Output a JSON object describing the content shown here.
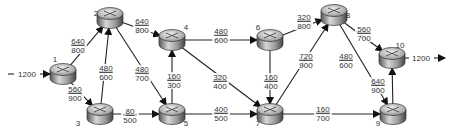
{
  "diagram": {
    "type": "flow-network",
    "source_flow": "1200",
    "sink_flow": "1200",
    "nodes": [
      {
        "id": "1",
        "x": 63,
        "y": 74,
        "lx": 55,
        "ly": 62
      },
      {
        "id": "2",
        "x": 110,
        "y": 18,
        "lx": 96,
        "ly": 16
      },
      {
        "id": "3",
        "x": 100,
        "y": 114,
        "lx": 78,
        "ly": 126
      },
      {
        "id": "4",
        "x": 172,
        "y": 40,
        "lx": 186,
        "ly": 30
      },
      {
        "id": "5",
        "x": 172,
        "y": 114,
        "lx": 186,
        "ly": 126
      },
      {
        "id": "6",
        "x": 270,
        "y": 40,
        "lx": 258,
        "ly": 30
      },
      {
        "id": "7",
        "x": 270,
        "y": 114,
        "lx": 258,
        "ly": 126
      },
      {
        "id": "8",
        "x": 334,
        "y": 15,
        "lx": 348,
        "ly": 18
      },
      {
        "id": "9",
        "x": 393,
        "y": 114,
        "lx": 378,
        "ly": 126
      },
      {
        "id": "10",
        "x": 392,
        "y": 58,
        "lx": 400,
        "ly": 48
      }
    ],
    "edges": [
      {
        "from": "1",
        "to": "2",
        "flow": "640",
        "capacity": "800",
        "tx": 78,
        "ty": 45
      },
      {
        "from": "1",
        "to": "3",
        "flow": "560",
        "capacity": "900",
        "tx": 75,
        "ty": 93
      },
      {
        "from": "3",
        "to": "2",
        "flow": "480",
        "capacity": "600",
        "tx": 106,
        "ty": 72
      },
      {
        "from": "2",
        "to": "4",
        "flow": "640",
        "capacity": "800",
        "tx": 142,
        "ty": 25
      },
      {
        "from": "2",
        "to": "5",
        "flow": "480",
        "capacity": "700",
        "tx": 142,
        "ty": 73
      },
      {
        "from": "3",
        "to": "5",
        "flow": "80",
        "capacity": "500",
        "tx": 130,
        "ty": 115
      },
      {
        "from": "5",
        "to": "4",
        "flow": "160",
        "capacity": "300",
        "tx": 174,
        "ty": 80
      },
      {
        "from": "4",
        "to": "6",
        "flow": "480",
        "capacity": "600",
        "tx": 221,
        "ty": 35
      },
      {
        "from": "4",
        "to": "7",
        "flow": "320",
        "capacity": "400",
        "tx": 220,
        "ty": 81
      },
      {
        "from": "5",
        "to": "7",
        "flow": "400",
        "capacity": "500",
        "tx": 221,
        "ty": 113
      },
      {
        "from": "6",
        "to": "7",
        "flow": "160",
        "capacity": "400",
        "tx": 271,
        "ty": 81
      },
      {
        "from": "6",
        "to": "8",
        "flow": "320",
        "capacity": "800",
        "tx": 304,
        "ty": 21
      },
      {
        "from": "7",
        "to": "8",
        "flow": "720",
        "capacity": "900",
        "tx": 306,
        "ty": 60
      },
      {
        "from": "7",
        "to": "9",
        "flow": "160",
        "capacity": "700",
        "tx": 323,
        "ty": 113
      },
      {
        "from": "8",
        "to": "9",
        "flow": "480",
        "capacity": "600",
        "tx": 346,
        "ty": 60
      },
      {
        "from": "8",
        "to": "10",
        "flow": "560",
        "capacity": "700",
        "tx": 364,
        "ty": 33
      },
      {
        "from": "9",
        "to": "10",
        "flow": "640",
        "capacity": "900",
        "tx": 378,
        "ty": 85
      }
    ]
  }
}
